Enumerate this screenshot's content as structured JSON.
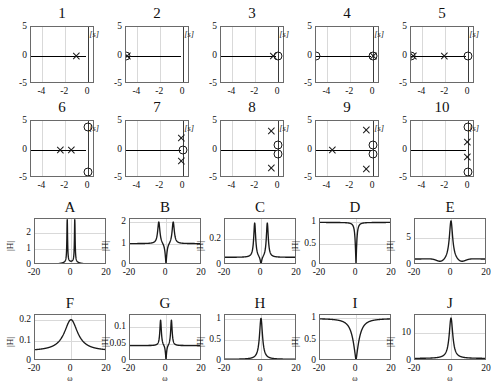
{
  "figure": {
    "width": 488,
    "height": 379,
    "background": "#ffffff",
    "line_color": "#1a1a1a",
    "grid_color": "#d9d9d9",
    "axis_color": "#6a6a6a"
  },
  "pole_zero_panels": [
    {
      "title": "1",
      "splane_label": "[s]",
      "xticks": [
        "-4",
        "-2",
        "0"
      ],
      "xtick_values": [
        -4,
        -2,
        0
      ],
      "yticks": [
        "5",
        "0",
        "-5"
      ],
      "ytick_values": [
        5,
        0,
        -5
      ],
      "xlim": [
        -5,
        0.6
      ],
      "ylim": [
        -5,
        5
      ],
      "poles": [
        {
          "re": -1,
          "im": 0
        }
      ],
      "zeros": []
    },
    {
      "title": "2",
      "splane_label": "[s]",
      "xticks": [
        "-4",
        "-2",
        "0"
      ],
      "xtick_values": [
        -4,
        -2,
        0
      ],
      "yticks": [
        "5",
        "0",
        "-5"
      ],
      "ytick_values": [
        5,
        0,
        -5
      ],
      "xlim": [
        -5,
        0.6
      ],
      "ylim": [
        -5,
        5
      ],
      "poles": [
        {
          "re": -4.85,
          "im": 0
        }
      ],
      "zeros": [
        {
          "re": -5,
          "im": 0
        }
      ]
    },
    {
      "title": "3",
      "splane_label": "[s]",
      "xticks": [
        "-4",
        "-2",
        "0"
      ],
      "xtick_values": [
        -4,
        -2,
        0
      ],
      "yticks": [
        "5",
        "0",
        "-5"
      ],
      "ytick_values": [
        5,
        0,
        -5
      ],
      "xlim": [
        -5,
        0.6
      ],
      "ylim": [
        -5,
        5
      ],
      "poles": [
        {
          "re": -0.45,
          "im": 0
        }
      ],
      "zeros": [
        {
          "re": 0,
          "im": 0
        }
      ]
    },
    {
      "title": "4",
      "splane_label": "[s]",
      "xticks": [
        "-4",
        "-2",
        "0"
      ],
      "xtick_values": [
        -4,
        -2,
        0
      ],
      "yticks": [
        "5",
        "0",
        "-5"
      ],
      "ytick_values": [
        5,
        0,
        -5
      ],
      "xlim": [
        -5,
        0.6
      ],
      "ylim": [
        -5,
        5
      ],
      "poles": [
        {
          "re": 0,
          "im": 0
        }
      ],
      "zeros": [
        {
          "re": -5,
          "im": 0
        },
        {
          "re": 0,
          "im": 0
        }
      ]
    },
    {
      "title": "5",
      "splane_label": "[s]",
      "xticks": [
        "-4",
        "-2",
        "0"
      ],
      "xtick_values": [
        -4,
        -2,
        0
      ],
      "yticks": [
        "5",
        "0",
        "-5"
      ],
      "ytick_values": [
        5,
        0,
        -5
      ],
      "xlim": [
        -5,
        0.6
      ],
      "ylim": [
        -5,
        5
      ],
      "poles": [
        {
          "re": -4.8,
          "im": 0
        },
        {
          "re": -2.1,
          "im": 0
        }
      ],
      "zeros": [
        {
          "re": -5,
          "im": 0
        },
        {
          "re": 0,
          "im": 0
        }
      ]
    },
    {
      "title": "6",
      "splane_label": "[s]",
      "xticks": [
        "-4",
        "-2",
        "0"
      ],
      "xtick_values": [
        -4,
        -2,
        0
      ],
      "yticks": [
        "5",
        "0",
        "-5"
      ],
      "ytick_values": [
        5,
        0,
        -5
      ],
      "xlim": [
        -5,
        0.6
      ],
      "ylim": [
        -5,
        5
      ],
      "poles": [
        {
          "re": -2.4,
          "im": 0
        },
        {
          "re": -1.5,
          "im": 0
        }
      ],
      "zeros": [
        {
          "re": 0,
          "im": 4.0
        },
        {
          "re": 0,
          "im": -4.0
        }
      ]
    },
    {
      "title": "7",
      "splane_label": "[s]",
      "xticks": [
        "-4",
        "-2",
        "0"
      ],
      "xtick_values": [
        -4,
        -2,
        0
      ],
      "yticks": [
        "5",
        "0",
        "-5"
      ],
      "ytick_values": [
        5,
        0,
        -5
      ],
      "xlim": [
        -5,
        0.6
      ],
      "ylim": [
        -5,
        5
      ],
      "poles": [
        {
          "re": -0.15,
          "im": 2.1
        },
        {
          "re": -0.15,
          "im": -2.1
        }
      ],
      "zeros": [
        {
          "re": 0,
          "im": 0
        }
      ]
    },
    {
      "title": "8",
      "splane_label": "[s]",
      "xticks": [
        "-4",
        "-2",
        "0"
      ],
      "xtick_values": [
        -4,
        -2,
        0
      ],
      "yticks": [
        "5",
        "0",
        "-5"
      ],
      "ytick_values": [
        5,
        0,
        -5
      ],
      "xlim": [
        -5,
        0.6
      ],
      "ylim": [
        -5,
        5
      ],
      "poles": [
        {
          "re": -0.6,
          "im": 3.3
        },
        {
          "re": -0.6,
          "im": -3.3
        }
      ],
      "zeros": [
        {
          "re": 0,
          "im": 0.85
        },
        {
          "re": 0,
          "im": -0.85
        }
      ]
    },
    {
      "title": "9",
      "splane_label": "[s]",
      "xticks": [
        "-4",
        "-2",
        "0"
      ],
      "xtick_values": [
        -4,
        -2,
        0
      ],
      "yticks": [
        "5",
        "0",
        "-5"
      ],
      "ytick_values": [
        5,
        0,
        -5
      ],
      "xlim": [
        -5,
        0.6
      ],
      "ylim": [
        -5,
        5
      ],
      "poles": [
        {
          "re": -3.6,
          "im": 0
        },
        {
          "re": -0.6,
          "im": 3.4
        },
        {
          "re": -0.6,
          "im": -3.4
        }
      ],
      "zeros": [
        {
          "re": 0,
          "im": 0.85
        },
        {
          "re": 0,
          "im": -0.85
        }
      ]
    },
    {
      "title": "10",
      "splane_label": "[s]",
      "xticks": [
        "-4",
        "-2",
        "0"
      ],
      "xtick_values": [
        -4,
        -2,
        0
      ],
      "yticks": [
        "5",
        "0",
        "-5"
      ],
      "ytick_values": [
        5,
        0,
        -5
      ],
      "xlim": [
        -5,
        0.6
      ],
      "ylim": [
        -5,
        5
      ],
      "poles": [
        {
          "re": -0.1,
          "im": 1.3
        },
        {
          "re": -0.1,
          "im": -1.3
        }
      ],
      "zeros": [
        {
          "re": 0,
          "im": 4.0
        },
        {
          "re": 0,
          "im": -4.0
        }
      ]
    }
  ],
  "magnitude_panels": [
    {
      "title": "A",
      "ylabel": "|H|",
      "xlabel": "",
      "xticks": [
        "-20",
        "0",
        "20"
      ],
      "xtick_values": [
        -20,
        0,
        20
      ],
      "yticks": [
        "0",
        "1",
        "2"
      ],
      "ytick_values": [
        0,
        1,
        2
      ],
      "xlim": [
        -20,
        20
      ],
      "ylim": [
        0,
        2.85
      ],
      "shape": "twin-peaks",
      "peak_omega": 2.1,
      "peak_value": 2.75,
      "baseline": 0.0,
      "center_value": 0.22,
      "width": 0.45
    },
    {
      "title": "B",
      "ylabel": "|H|",
      "xlabel": "",
      "xticks": [
        "-20",
        "0",
        "20"
      ],
      "xtick_values": [
        -20,
        0,
        20
      ],
      "yticks": [
        "0",
        "1",
        "2"
      ],
      "ytick_values": [
        0,
        1,
        2
      ],
      "xlim": [
        -20,
        20
      ],
      "ylim": [
        0,
        2.15
      ],
      "shape": "notch-peaks",
      "peak_omega": 4.0,
      "peak_value": 2.05,
      "baseline": 1.0,
      "center_value": 0.0,
      "width": 1.5
    },
    {
      "title": "C",
      "ylabel": "|H|",
      "xlabel": "",
      "xticks": [
        "-20",
        "0",
        "20"
      ],
      "xtick_values": [
        -20,
        0,
        20
      ],
      "yticks": [
        "0",
        "0.2"
      ],
      "ytick_values": [
        0,
        0.2
      ],
      "xlim": [
        -20,
        20
      ],
      "ylim": [
        0,
        0.36
      ],
      "shape": "notch-peaks",
      "peak_omega": 3.5,
      "peak_value": 0.335,
      "baseline": 0.06,
      "center_value": 0.0,
      "width": 1.3
    },
    {
      "title": "D",
      "ylabel": "|H|",
      "xlabel": "",
      "xticks": [
        "-20",
        "0",
        "20"
      ],
      "xtick_values": [
        -20,
        0,
        20
      ],
      "yticks": [
        "0",
        "0.5",
        "1"
      ],
      "ytick_values": [
        0,
        0.5,
        1
      ],
      "xlim": [
        -20,
        20
      ],
      "ylim": [
        0,
        1.08
      ],
      "shape": "notch",
      "peak_omega": 0,
      "peak_value": 1.0,
      "baseline": 1.0,
      "center_value": 0.0,
      "width": 0.7
    },
    {
      "title": "E",
      "ylabel": "|H|",
      "xlabel": "",
      "xticks": [
        "-20",
        "0",
        "20"
      ],
      "xtick_values": [
        -20,
        0,
        20
      ],
      "yticks": [
        "0",
        "5"
      ],
      "ytick_values": [
        0,
        5
      ],
      "xlim": [
        -20,
        20
      ],
      "ylim": [
        0,
        8.6
      ],
      "shape": "center-peak-dips",
      "peak_omega": 0,
      "peak_value": 8.3,
      "baseline": 1.1,
      "center_value": 8.3,
      "width": 1.1,
      "dip_omega": 5.5,
      "dip_value": 0.45
    },
    {
      "title": "F",
      "ylabel": "|H|",
      "xlabel": "ω",
      "xticks": [
        "-20",
        "0",
        "20"
      ],
      "xtick_values": [
        -20,
        0,
        20
      ],
      "yticks": [
        "0",
        "0.1",
        "0.2"
      ],
      "ytick_values": [
        0,
        0.1,
        0.2
      ],
      "xlim": [
        -20,
        20
      ],
      "ylim": [
        0,
        0.225
      ],
      "shape": "center-peak",
      "peak_omega": 0,
      "peak_value": 0.202,
      "baseline": 0.048,
      "center_value": 0.202,
      "width": 4.5
    },
    {
      "title": "G",
      "ylabel": "|H|",
      "xlabel": "ω",
      "xticks": [
        "-20",
        "0",
        "20"
      ],
      "xtick_values": [
        -20,
        0,
        20
      ],
      "yticks": [
        "0",
        "0.05",
        "0.1"
      ],
      "ytick_values": [
        0,
        0.05,
        0.1
      ],
      "xlim": [
        -20,
        20
      ],
      "ylim": [
        0,
        0.135
      ],
      "shape": "notch-peaks",
      "peak_omega": 3.0,
      "peak_value": 0.122,
      "baseline": 0.045,
      "center_value": 0.0,
      "width": 1.0
    },
    {
      "title": "H",
      "ylabel": "|H|",
      "xlabel": "ω",
      "xticks": [
        "-20",
        "0",
        "20"
      ],
      "xtick_values": [
        -20,
        0,
        20
      ],
      "yticks": [
        "0",
        "0.5",
        "1"
      ],
      "ytick_values": [
        0,
        0.5,
        1
      ],
      "xlim": [
        -20,
        20
      ],
      "ylim": [
        0,
        1.1
      ],
      "shape": "center-peak",
      "peak_omega": 0,
      "peak_value": 1.02,
      "baseline": 0.04,
      "center_value": 1.02,
      "width": 1.0
    },
    {
      "title": "I",
      "ylabel": "|H|",
      "xlabel": "ω",
      "xticks": [
        "-20",
        "0",
        "20"
      ],
      "xtick_values": [
        -20,
        0,
        20
      ],
      "yticks": [
        "0",
        "0.5",
        "1"
      ],
      "ytick_values": [
        0,
        0.5,
        1
      ],
      "xlim": [
        -20,
        20
      ],
      "ylim": [
        0,
        1.08
      ],
      "shape": "notch",
      "peak_omega": 0,
      "peak_value": 1.0,
      "baseline": 1.0,
      "center_value": 0.0,
      "width": 3.0
    },
    {
      "title": "J",
      "ylabel": "|H|",
      "xlabel": "ω",
      "xticks": [
        "-20",
        "0",
        "20"
      ],
      "xtick_values": [
        -20,
        0,
        20
      ],
      "yticks": [
        "0",
        "10"
      ],
      "ytick_values": [
        0,
        10
      ],
      "xlim": [
        -20,
        20
      ],
      "ylim": [
        0,
        16.5
      ],
      "shape": "center-peak-flat",
      "peak_omega": 0,
      "peak_value": 15.4,
      "baseline": 0.9,
      "center_value": 15.4,
      "width": 1.2
    }
  ]
}
